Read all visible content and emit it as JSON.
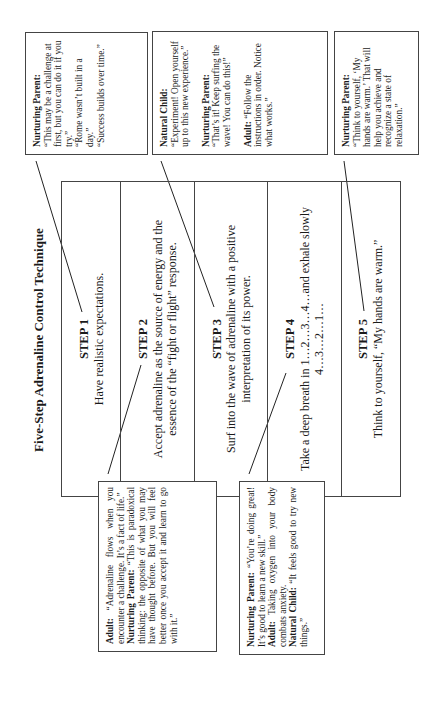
{
  "title": "Five-Step Adrenaline Control Technique",
  "steps": [
    {
      "label": "STEP 1",
      "text": "Have realistic expectations."
    },
    {
      "label": "STEP 2",
      "text": "Accept adrenaline as the source of energy and the essence of the “fight or flight” response."
    },
    {
      "label": "STEP 3",
      "text": "Surf into the wave of adrenaline with a positive interpretation of its power."
    },
    {
      "label": "STEP 4",
      "text": "Take a deep breath in 1…2…3…4…and exhale slowly",
      "text2": "4…3…2…1…"
    },
    {
      "label": "STEP 5",
      "text": "Think to yourself, “My hands are warm.”"
    }
  ],
  "callouts": {
    "step1": {
      "role": "Nurturing Parent:",
      "lines": [
        "“This may be a challenge at first, but you can do it if you try.”",
        "“Rome wasn’t built in a day.”",
        "“Success builds over time.”"
      ]
    },
    "step2": {
      "adult_role": "Adult:",
      "adult_text": "“Adrenaline flows when you encounter a challenge. It’s a fact of life.”",
      "np_role": "Nurturing Parent:",
      "np_text": "“This is paradoxical thinking: the opposite of what you may have thought before. But you will feel better once you accept it and learn to go with it.”"
    },
    "step3": {
      "nc_role": "Natural Child:",
      "nc_text": "“Experiment! Open yourself up to this new experience.”",
      "np_role": "Nurturing Parent:",
      "np_text": "“That’s it! Keep surfing the wave! You can do this!”",
      "adult_role": "Adult:",
      "adult_text": "“Follow the instructions in order. Notice what works.”"
    },
    "step4": {
      "np_role": "Nurturing Parent:",
      "np_text": "“You’re doing great! It’s good to learn a new skill.”",
      "adult_role": "Adult:",
      "adult_text": "Taking oxygen into your body combats anxiety.",
      "nc_role": "Natural Child:",
      "nc_text": "“It feels good to try new things.”"
    },
    "step5": {
      "role": "Nurturing Parent:",
      "text": "“Think to yourself, ‘My hands are warm.’ That will help you achieve and recognize a state of relaxation.”"
    }
  }
}
